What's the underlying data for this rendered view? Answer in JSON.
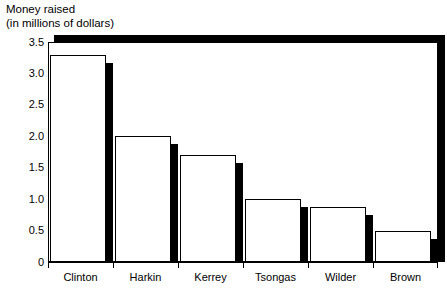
{
  "chart_data": {
    "type": "bar",
    "title": "Money raised\n(in millions of dollars)",
    "title_lines": [
      "Money raised",
      "(in millions of dollars)"
    ],
    "categories": [
      "Clinton",
      "Harkin",
      "Kerrey",
      "Tsongas",
      "Wilder",
      "Brown"
    ],
    "values": [
      3.3,
      2.0,
      1.7,
      1.0,
      0.87,
      0.5
    ],
    "xlabel": "",
    "ylabel": "Money raised (in millions of dollars)",
    "ylim": [
      0,
      3.5
    ],
    "yticks": [
      "0",
      "0.5",
      "1.0",
      "1.5",
      "2.0",
      "2.5",
      "3.0",
      "3.5"
    ],
    "ytick_values": [
      0,
      0.5,
      1.0,
      1.5,
      2.0,
      2.5,
      3.0,
      3.5
    ],
    "grid": false,
    "legend": null,
    "style": {
      "bar_fill": "#ffffff",
      "bar_edge": "#000000",
      "shadow": "#000000",
      "background": "#ffffff"
    }
  }
}
